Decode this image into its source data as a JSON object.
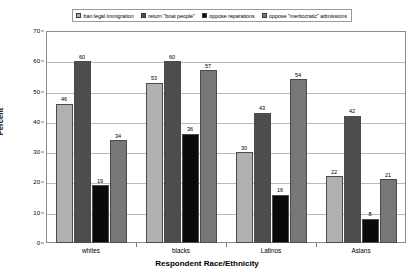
{
  "chart_data": {
    "type": "bar",
    "title": "",
    "xlabel": "Respondent Race/Ethnicity",
    "ylabel": "Percent",
    "categories": [
      "whites",
      "blacks",
      "Latinos",
      "Asians"
    ],
    "ylim": [
      0,
      70
    ],
    "yticks": [
      0,
      10,
      20,
      30,
      40,
      50,
      60,
      70
    ],
    "grid": true,
    "legend_position": "top",
    "series": [
      {
        "name": "ban legal immigration",
        "color": "#b0b0b0",
        "values": [
          46,
          53,
          30,
          22
        ]
      },
      {
        "name": "return \"boat people\"",
        "color": "#4d4d4d",
        "values": [
          60,
          60,
          43,
          42
        ]
      },
      {
        "name": "oppose reparations",
        "color": "#0a0a0a",
        "values": [
          19,
          36,
          16,
          8
        ]
      },
      {
        "name": "oppose \"meritocratic\" admissions",
        "color": "#777777",
        "values": [
          34,
          57,
          54,
          21
        ]
      }
    ]
  }
}
